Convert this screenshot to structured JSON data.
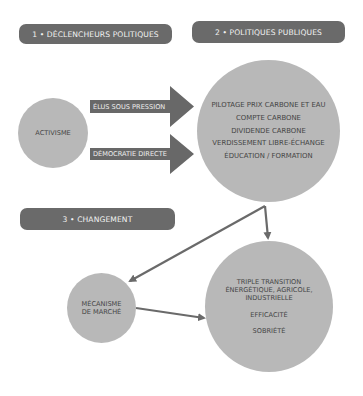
{
  "headers": {
    "step1": "1 • DÉCLENCHEURS POLITIQUES",
    "step2": "2 • POLITIQUES PUBLIQUES",
    "step3": "3 • CHANGEMENT"
  },
  "nodes": {
    "activisme": "ACTIVISME",
    "politiques": [
      "PILOTAGE PRIX CARBONE ET EAU",
      "COMPTE CARBONE",
      "DIVIDENDE CARBONE",
      "VERDISSEMENT LIBRE-ÉCHANGE",
      "ÉDUCATION / FORMATION"
    ],
    "mecanisme": [
      "MÉCANISME",
      "DE MARCHÉ"
    ],
    "changement": {
      "transition": [
        "TRIPLE TRANSITION",
        "ÉNERGÉTIQUE, AGRICOLE,",
        "INDUSTRIELLE"
      ],
      "efficacite": "EFFICACITÉ",
      "sobriete": "SOBRIÉTÉ"
    }
  },
  "arrows": {
    "elus": "ÉLUS SOUS PRESSION",
    "democratie": "DÉMOCRATIE DIRECTE"
  },
  "colors": {
    "header_bg": "#6a6a6a",
    "circle_fill": "#b8b8b8",
    "arrow_fill": "#686868"
  }
}
